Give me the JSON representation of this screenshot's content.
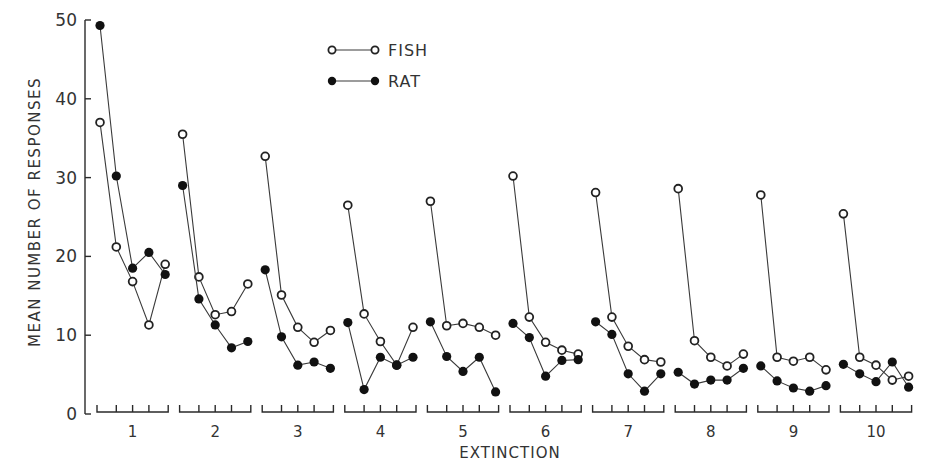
{
  "chart_data": {
    "type": "line",
    "title": "",
    "xlabel": "EXTINCTION",
    "ylabel": "MEAN NUMBER OF RESPONSES",
    "ylim": [
      0,
      50
    ],
    "yticks": [
      0,
      10,
      20,
      30,
      40,
      50
    ],
    "grid": false,
    "legend_position": "top-center",
    "categories": [
      "1",
      "2",
      "3",
      "4",
      "5",
      "6",
      "7",
      "8",
      "9",
      "10"
    ],
    "points_per_category": 5,
    "series": [
      {
        "name": "FISH",
        "marker": "open-circle",
        "values": [
          [
            37,
            21.2,
            16.8,
            11.3,
            19
          ],
          [
            35.5,
            17.4,
            12.6,
            13,
            16.5
          ],
          [
            32.7,
            15.1,
            11,
            9.1,
            10.6
          ],
          [
            26.5,
            12.7,
            9.2,
            6.2,
            11
          ],
          [
            27,
            11.2,
            11.5,
            11,
            10
          ],
          [
            30.2,
            12.3,
            9.1,
            8.1,
            7.6
          ],
          [
            28.1,
            12.3,
            8.6,
            6.9,
            6.6
          ],
          [
            28.6,
            9.3,
            7.2,
            6.1,
            7.6
          ],
          [
            27.8,
            7.2,
            6.7,
            7.2,
            5.6
          ],
          [
            25.4,
            7.2,
            6.2,
            4.3,
            4.8
          ]
        ]
      },
      {
        "name": "RAT",
        "marker": "filled-circle",
        "values": [
          [
            49.3,
            30.2,
            18.5,
            20.5,
            17.7
          ],
          [
            29,
            14.6,
            11.3,
            8.4,
            9.2
          ],
          [
            18.3,
            9.8,
            6.2,
            6.6,
            5.8
          ],
          [
            11.6,
            3.1,
            7.2,
            6.2,
            7.2
          ],
          [
            11.7,
            7.3,
            5.4,
            7.2,
            2.8
          ],
          [
            11.5,
            9.7,
            4.8,
            6.8,
            6.9
          ],
          [
            11.7,
            10.1,
            5.1,
            2.9,
            5.1
          ],
          [
            5.3,
            3.8,
            4.3,
            4.3,
            5.8
          ],
          [
            6.1,
            4.2,
            3.3,
            2.9,
            3.6
          ],
          [
            6.3,
            5.1,
            4.1,
            6.6,
            3.4
          ]
        ]
      }
    ]
  },
  "legend": {
    "fish_label": "FISH",
    "rat_label": "RAT"
  },
  "axes": {
    "y_label": "MEAN NUMBER OF RESPONSES",
    "x_label": "EXTINCTION",
    "y_tick_labels": [
      "0",
      "10",
      "20",
      "30",
      "40",
      "50"
    ],
    "x_group_labels": [
      "1",
      "2",
      "3",
      "4",
      "5",
      "6",
      "7",
      "8",
      "9",
      "10"
    ]
  }
}
